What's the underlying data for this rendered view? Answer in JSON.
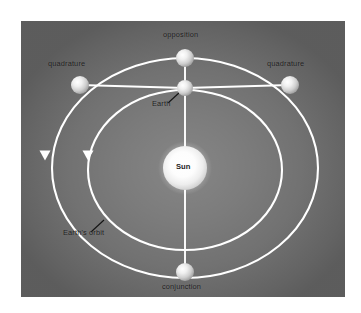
{
  "figure": {
    "type": "astronomy-diagram",
    "background_color": "#6f6f6f",
    "orbit_color": "#ffffff",
    "label_color": "#1b1b1b"
  },
  "labels": {
    "opposition": "opposition",
    "quadrature_left": "quadrature",
    "quadrature_right": "quadrature",
    "earth": "Earth",
    "sun": "Sun",
    "earths_orbit": "Earth's orbit",
    "conjunction": "conjunction"
  },
  "bodies": [
    {
      "name": "sun",
      "label": "Sun",
      "x": 185,
      "y": 168,
      "radius": 22
    },
    {
      "name": "planet-opposition",
      "label": "opposition",
      "x": 185,
      "y": 58,
      "radius": 9
    },
    {
      "name": "earth",
      "label": "Earth",
      "x": 185,
      "y": 88,
      "radius": 8
    },
    {
      "name": "planet-quadrature-left",
      "label": "quadrature",
      "x": 80,
      "y": 85,
      "radius": 9
    },
    {
      "name": "planet-quadrature-right",
      "label": "quadrature",
      "x": 290,
      "y": 85,
      "radius": 9
    },
    {
      "name": "planet-conjunction",
      "label": "conjunction",
      "x": 185,
      "y": 272,
      "radius": 9
    }
  ],
  "orbits": [
    {
      "name": "superior-planet-orbit",
      "cx": 185,
      "cy": 168,
      "rx": 133,
      "ry": 110
    },
    {
      "name": "earths-orbit",
      "cx": 185,
      "cy": 170,
      "rx": 97,
      "ry": 80
    }
  ],
  "direction_markers": [
    {
      "name": "outer-orbit-direction-arrow",
      "x": 45,
      "y": 155,
      "points": "down"
    },
    {
      "name": "inner-orbit-direction-arrow",
      "x": 88,
      "y": 155,
      "points": "down"
    }
  ]
}
